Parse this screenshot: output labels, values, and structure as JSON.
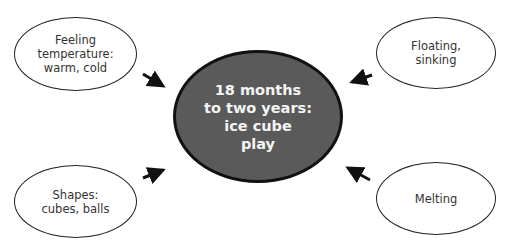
{
  "diagram": {
    "center": {
      "label": "18 months\nto two years:\nice cube\nplay",
      "fill": "#5a5a5a",
      "text_color": "#f4f4f4"
    },
    "nodes": [
      {
        "id": "top-left",
        "label": "Feeling\ntemperature:\nwarm, cold"
      },
      {
        "id": "top-right",
        "label": "Floating,\nsinking"
      },
      {
        "id": "bottom-left",
        "label": "Shapes:\ncubes, balls"
      },
      {
        "id": "bottom-right",
        "label": "Melting"
      }
    ],
    "edges": [
      {
        "from": "top-left",
        "to": "center",
        "style": "arrow"
      },
      {
        "from": "top-right",
        "to": "center",
        "style": "arrow"
      },
      {
        "from": "bottom-left",
        "to": "center",
        "style": "arrow"
      },
      {
        "from": "bottom-right",
        "to": "center",
        "style": "arrow"
      }
    ]
  }
}
